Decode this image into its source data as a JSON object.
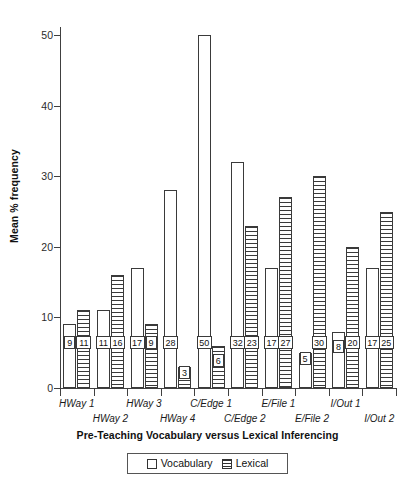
{
  "chart_data": {
    "type": "bar",
    "title": "",
    "xlabel": "Pre-Teaching Vocabulary versus Lexical Inferencing",
    "ylabel": "Mean % frequency",
    "ylim": [
      0,
      53
    ],
    "yticks": [
      0,
      10,
      20,
      30,
      40,
      50
    ],
    "grid": false,
    "legend_position": "bottom",
    "categories": [
      "HWay 1",
      "HWay 2",
      "HWay 3",
      "HWay 4",
      "C/Edge 1",
      "C/Edge 2",
      "E/File 1",
      "E/File 2",
      "I/Out 1",
      "I/Out 2"
    ],
    "series": [
      {
        "name": "Vocabulary",
        "fill": "white",
        "values": [
          9,
          11,
          17,
          28,
          50,
          32,
          17,
          5,
          8,
          17
        ]
      },
      {
        "name": "Lexical",
        "fill": "horizontal-stripes",
        "values": [
          11,
          16,
          9,
          3,
          6,
          23,
          27,
          30,
          20,
          25
        ]
      }
    ]
  },
  "axes": {
    "y_tick_labels": [
      "0",
      "10",
      "20",
      "30",
      "40",
      "50"
    ],
    "y_title": "Mean % frequency",
    "x_title": "Pre-Teaching Vocabulary versus Lexical Inferencing",
    "x_group_labels": [
      "HWay 1",
      "HWay 2",
      "HWay 3",
      "HWay 4",
      "C/Edge 1",
      "C/Edge 2",
      "E/File 1",
      "E/File 2",
      "I/Out 1",
      "I/Out 2"
    ]
  },
  "legend": {
    "items": [
      {
        "label": "Vocabulary",
        "pattern": "empty"
      },
      {
        "label": "Lexical",
        "pattern": "horizontal-stripes"
      }
    ]
  }
}
